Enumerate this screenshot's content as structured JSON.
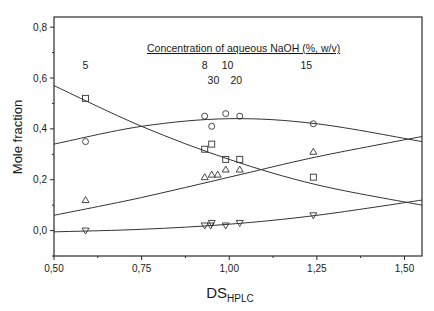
{
  "chart_data": {
    "type": "scatter",
    "title": "",
    "xlabel": "DS",
    "xlabel_subscript": "HPLC",
    "ylabel": "Mole fraction",
    "xlim": [
      0.5,
      1.55
    ],
    "ylim": [
      -0.1,
      0.84
    ],
    "x_ticks": [
      0.5,
      0.75,
      1.0,
      1.25,
      1.5
    ],
    "x_tick_labels": [
      "0,50",
      "0,75",
      "1,00",
      "1,25",
      "1,50"
    ],
    "x_minor_ticks": [
      0.625,
      0.875,
      1.125,
      1.375
    ],
    "y_ticks": [
      0.0,
      0.2,
      0.4,
      0.6,
      0.8
    ],
    "y_tick_labels": [
      "0,0",
      "0,2",
      "0,4",
      "0,6",
      "0,8"
    ],
    "y_minor_ticks": [
      -0.1,
      0.1,
      0.3,
      0.5,
      0.7
    ],
    "grid": false,
    "legend": null,
    "annotation_title": "Concentration of aqueous NaOH (%, w/v)",
    "annotations": [
      {
        "text": "5",
        "x": 0.59,
        "y": 0.635
      },
      {
        "text": "8",
        "x": 0.93,
        "y": 0.635
      },
      {
        "text": "10",
        "x": 0.995,
        "y": 0.635
      },
      {
        "text": "15",
        "x": 1.22,
        "y": 0.635
      },
      {
        "text": "30",
        "x": 0.955,
        "y": 0.575
      },
      {
        "text": "20",
        "x": 1.02,
        "y": 0.575
      }
    ],
    "x": [
      0.59,
      0.93,
      0.95,
      0.99,
      1.03,
      1.24
    ],
    "series": [
      {
        "name": "square",
        "marker": "square",
        "values": [
          0.52,
          0.32,
          0.34,
          0.28,
          0.28,
          0.21
        ],
        "fit_curve": {
          "x": [
            0.5,
            0.75,
            1.0,
            1.25,
            1.55
          ],
          "y": [
            0.57,
            0.41,
            0.28,
            0.18,
            0.1
          ]
        }
      },
      {
        "name": "circle",
        "marker": "circle",
        "values": [
          0.35,
          0.45,
          0.41,
          0.46,
          0.45,
          0.42
        ],
        "fit_curve": {
          "x": [
            0.5,
            0.75,
            1.0,
            1.25,
            1.55
          ],
          "y": [
            0.34,
            0.41,
            0.44,
            0.42,
            0.35
          ]
        }
      },
      {
        "name": "triangle-up",
        "marker": "triangle-up",
        "values": [
          0.12,
          0.21,
          0.22,
          0.24,
          0.24,
          0.31
        ],
        "fit_curve": {
          "x": [
            0.5,
            0.75,
            1.0,
            1.25,
            1.55
          ],
          "y": [
            0.06,
            0.13,
            0.21,
            0.29,
            0.37
          ]
        }
      },
      {
        "name": "triangle-down",
        "marker": "triangle-down",
        "values": [
          0.0,
          0.02,
          0.03,
          0.02,
          0.03,
          0.06
        ],
        "fit_curve": {
          "x": [
            0.5,
            0.75,
            1.0,
            1.25,
            1.55
          ],
          "y": [
            -0.005,
            0.005,
            0.025,
            0.06,
            0.12
          ]
        }
      }
    ],
    "extra_points": [
      {
        "series": "triangle-up",
        "x": 0.95,
        "y": 0.22
      },
      {
        "series": "triangle-down",
        "x": 0.93,
        "y": 0.02
      }
    ]
  }
}
